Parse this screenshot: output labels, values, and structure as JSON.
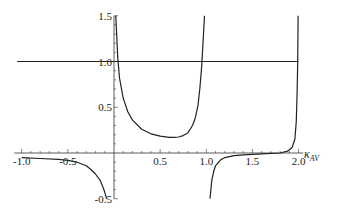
{
  "chart_data": {
    "type": "line",
    "title": "",
    "xlabel": "κ_AV",
    "xlabel_main": "κ",
    "xlabel_sub": "AV",
    "ylabel": "",
    "xlim": [
      -1.0,
      2.0
    ],
    "ylim": [
      -0.5,
      1.5
    ],
    "grid": false,
    "x_ticks": [
      -1.0,
      -0.5,
      0.5,
      1.0,
      1.5,
      2.0
    ],
    "x_tick_labels": [
      "-1.0",
      "-0.5",
      "0.5",
      "1.0",
      "1.5",
      "2.0"
    ],
    "y_ticks": [
      -0.5,
      0.5,
      1.0,
      1.5
    ],
    "y_tick_labels": [
      "-0.5",
      "0.5",
      "1.0",
      "1.5"
    ],
    "vertical_asymptotes": [
      0.0,
      1.0,
      2.0
    ],
    "series": [
      {
        "name": "reference line y=1",
        "x": [
          -1.05,
          2.0
        ],
        "y": [
          1.0,
          1.0
        ]
      },
      {
        "name": "curve branch x<0",
        "x": [
          -1.0,
          -0.8,
          -0.6,
          -0.5,
          -0.4,
          -0.3,
          -0.25,
          -0.2,
          -0.15,
          -0.12,
          -0.1,
          -0.08
        ],
        "y": [
          -0.05,
          -0.06,
          -0.07,
          -0.08,
          -0.1,
          -0.14,
          -0.18,
          -0.23,
          -0.3,
          -0.37,
          -0.43,
          -0.5
        ]
      },
      {
        "name": "curve branch 0<x<1",
        "x": [
          0.02,
          0.04,
          0.06,
          0.1,
          0.15,
          0.2,
          0.3,
          0.4,
          0.5,
          0.6,
          0.65,
          0.7,
          0.75,
          0.8,
          0.85,
          0.88,
          0.91,
          0.93,
          0.95,
          0.97,
          0.98
        ],
        "y": [
          1.5,
          1.05,
          0.82,
          0.6,
          0.45,
          0.36,
          0.26,
          0.21,
          0.185,
          0.172,
          0.17,
          0.175,
          0.19,
          0.22,
          0.3,
          0.38,
          0.52,
          0.7,
          0.95,
          1.3,
          1.5
        ],
        "min_point": {
          "x": 0.65,
          "y": 0.17
        }
      },
      {
        "name": "curve branch 1<x<2",
        "x": [
          1.04,
          1.06,
          1.08,
          1.1,
          1.15,
          1.2,
          1.3,
          1.4,
          1.6,
          1.8,
          1.88,
          1.93,
          1.96,
          1.975,
          1.985,
          1.99,
          1.995
        ],
        "y": [
          -0.5,
          -0.3,
          -0.2,
          -0.14,
          -0.08,
          -0.05,
          -0.03,
          -0.02,
          -0.01,
          0.0,
          0.02,
          0.06,
          0.15,
          0.35,
          0.7,
          1.0,
          1.5
        ]
      }
    ]
  }
}
